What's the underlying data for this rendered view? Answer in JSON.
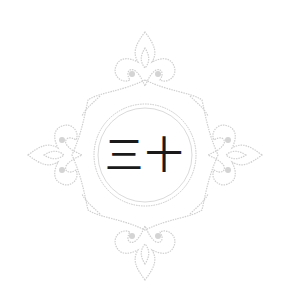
{
  "center_label": "三十",
  "colors": {
    "background": "#ffffff",
    "ornament": "#cfcfcf",
    "ornament_dark": "#b8b8b8",
    "text": "#1a1a1a"
  },
  "ornament": {
    "shape": "diamond-filigree-frame",
    "inner_ring": "double-circle"
  }
}
